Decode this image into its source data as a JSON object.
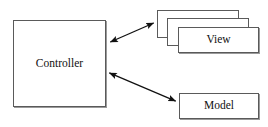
{
  "diagram": {
    "canvas": {
      "width": 268,
      "height": 127,
      "background": "#ffffff"
    },
    "style": {
      "stroke_color": "#5a5a5a",
      "arrow_color": "#111111",
      "text_color": "#111111",
      "fill_color": "#ffffff"
    },
    "nodes": [
      {
        "id": "controller",
        "label": "Controller",
        "shape": "rectangle",
        "x": 13,
        "y": 20,
        "width": 93,
        "height": 87
      },
      {
        "id": "view",
        "label": "View",
        "shape": "stacked-rectangle",
        "stack_count": 3,
        "x": 178,
        "y": 27,
        "width": 81,
        "height": 26
      },
      {
        "id": "model",
        "label": "Model",
        "shape": "rectangle",
        "x": 179,
        "y": 93,
        "width": 80,
        "height": 26
      }
    ],
    "edges": [
      {
        "id": "controller-view-edge",
        "from": "controller",
        "to": "view",
        "label": "",
        "arrowheads": "both",
        "x1": 108,
        "y1": 43,
        "x2": 156,
        "y2": 22
      },
      {
        "id": "controller-model-edge",
        "from": "controller",
        "to": "model",
        "label": "",
        "arrowheads": "both",
        "x1": 107,
        "y1": 72,
        "x2": 178,
        "y2": 102
      }
    ]
  }
}
